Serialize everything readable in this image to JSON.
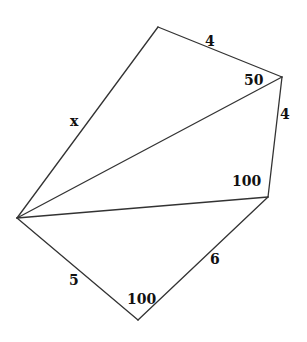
{
  "diagram": {
    "type": "geometry-figure",
    "colors": {
      "stroke": "#333333",
      "text": "#111111",
      "background": "#ffffff"
    },
    "vertices": {
      "apex": {
        "x": 17,
        "y": 218
      },
      "top": {
        "x": 158,
        "y": 27
      },
      "upper_right": {
        "x": 282,
        "y": 77
      },
      "right": {
        "x": 268,
        "y": 197
      },
      "bottom": {
        "x": 138,
        "y": 320
      }
    },
    "edges": [
      {
        "id": "apex-top",
        "from": "apex",
        "to": "top"
      },
      {
        "id": "top-upper_right",
        "from": "top",
        "to": "upper_right"
      },
      {
        "id": "apex-upper_right",
        "from": "apex",
        "to": "upper_right"
      },
      {
        "id": "upper_right-right",
        "from": "upper_right",
        "to": "right"
      },
      {
        "id": "apex-right",
        "from": "apex",
        "to": "right"
      },
      {
        "id": "right-bottom",
        "from": "right",
        "to": "bottom"
      },
      {
        "id": "apex-bottom",
        "from": "apex",
        "to": "bottom"
      }
    ],
    "labels": {
      "top_edge": {
        "text": "4",
        "x": 205,
        "y": 46
      },
      "upper_right_angle": {
        "text": "50",
        "x": 244,
        "y": 85
      },
      "left_edge": {
        "text": "x",
        "x": 70,
        "y": 126
      },
      "right_edge": {
        "text": "4",
        "x": 280,
        "y": 119
      },
      "right_angle": {
        "text": "100",
        "x": 232,
        "y": 186
      },
      "lower_left_edge": {
        "text": "5",
        "x": 69,
        "y": 285
      },
      "lower_right_edge": {
        "text": "6",
        "x": 210,
        "y": 264
      },
      "bottom_angle": {
        "text": "100",
        "x": 127,
        "y": 304
      }
    }
  }
}
